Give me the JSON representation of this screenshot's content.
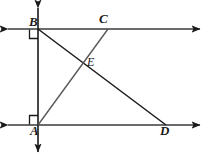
{
  "figure": {
    "stroke_color": "#1a1a1a",
    "background_color": "#ffffff",
    "stroke_width": 1.4
  },
  "points": {
    "A": {
      "label": "A",
      "x": 38,
      "y": 125
    },
    "B": {
      "label": "B",
      "x": 38,
      "y": 29
    },
    "C": {
      "label": "C",
      "x": 108,
      "y": 29
    },
    "D": {
      "label": "D",
      "x": 166,
      "y": 125
    },
    "E": {
      "label": "E",
      "x": 82,
      "y": 62
    }
  },
  "lines": {
    "top_line": {
      "name": "line-through-B-and-C",
      "x1": 8,
      "y1": 29,
      "x2": 200,
      "y2": 29,
      "arrows": "both"
    },
    "bottom_line": {
      "name": "line-through-A-and-D",
      "x1": 8,
      "y1": 125,
      "x2": 200,
      "y2": 125,
      "arrows": "both"
    },
    "vertical_line": {
      "name": "line-AB-transversal",
      "x1": 38,
      "y1": 6,
      "x2": 38,
      "y2": 154,
      "arrows": "both"
    }
  },
  "segments": {
    "BD": {
      "name": "segment-BD",
      "from": "B",
      "to": "D"
    },
    "AC": {
      "name": "segment-AC",
      "from": "A",
      "to": "C"
    }
  },
  "angle_marks": {
    "at_B": {
      "name": "right-angle-mark-B",
      "size": 9,
      "corner_x": 38,
      "corner_y": 29,
      "direction": "down-left"
    },
    "at_A": {
      "name": "right-angle-mark-A",
      "size": 9,
      "corner_x": 38,
      "corner_y": 125,
      "direction": "up-left"
    }
  }
}
